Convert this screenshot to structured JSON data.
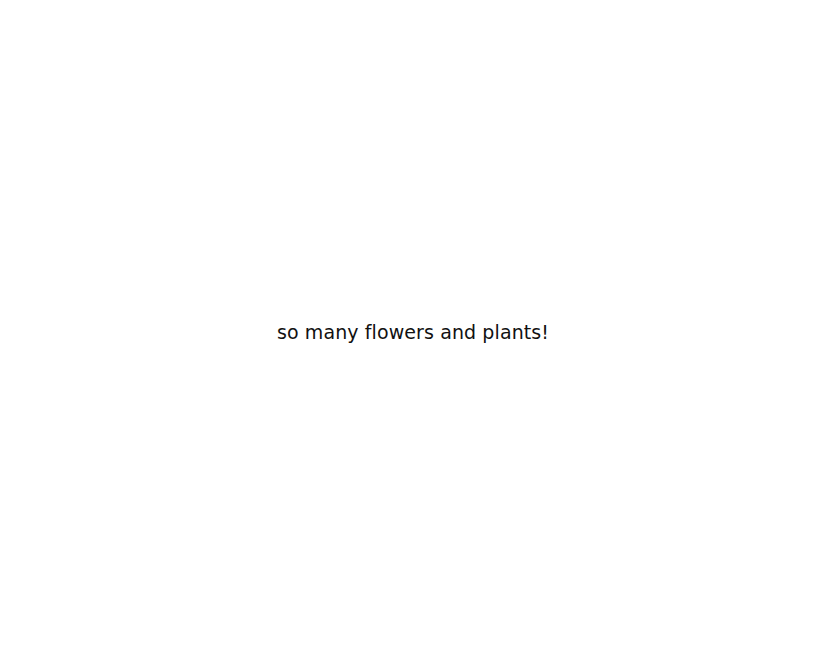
{
  "page": {
    "background": "#ffffff",
    "message": "so many flowers and plants!",
    "text_color": "#111111"
  }
}
